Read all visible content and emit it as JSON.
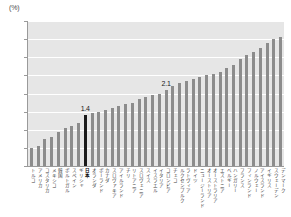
{
  "chart_data": {
    "type": "bar",
    "title": "",
    "xlabel": "",
    "ylabel": "",
    "unit_label": "(%)",
    "ylim": [
      0.0,
      4.0
    ],
    "ytick_labels": [
      "4.0",
      "3.5",
      "3.0",
      "2.5",
      "2.0",
      "1.5",
      "1.0",
      "0.5",
      "0.0"
    ],
    "ytick_values": [
      4.0,
      3.5,
      3.0,
      2.5,
      2.0,
      1.5,
      1.0,
      0.5,
      0.0
    ],
    "grid": true,
    "legend": "none",
    "categories": [
      "トルコ",
      "アメリカ",
      "コスタリカ",
      "メキシコ",
      "韓国",
      "ポルトガル",
      "スペイン",
      "ギリシャ",
      "日本",
      "オランダ",
      "ポーランド",
      "カナダ",
      "スロヴァキア",
      "アイルランド",
      "チリ",
      "リトアニア",
      "スロヴェニア",
      "スイス",
      "イスラエル",
      "イタリア",
      "コロンビア",
      "チェコ",
      "ルクセンブルク",
      "ラトヴィア",
      "ドイツ",
      "ニュージーランド",
      "オーストリア",
      "オーストラリア",
      "エストニア",
      "ベルギー",
      "ハンガリー",
      "フランス",
      "フィンランド",
      "ノルウェー",
      "アイスランド",
      "イギリス",
      "スウェーデン",
      "デンマーク"
    ],
    "values": [
      0.5,
      0.55,
      0.75,
      0.8,
      0.95,
      1.05,
      1.1,
      1.2,
      1.4,
      1.45,
      1.5,
      1.55,
      1.6,
      1.65,
      1.7,
      1.75,
      1.85,
      1.9,
      1.95,
      2.0,
      2.1,
      2.2,
      2.3,
      2.35,
      2.4,
      2.45,
      2.5,
      2.55,
      2.6,
      2.7,
      2.8,
      2.95,
      3.05,
      3.15,
      3.25,
      3.4,
      3.5,
      3.55
    ],
    "annotations": [
      {
        "category": "日本",
        "index": 8,
        "text": "1.4"
      },
      {
        "category": "コロンビア",
        "index": 20,
        "text": "2.1"
      }
    ],
    "highlighted_index": 8,
    "colors": {
      "bar": "#8c8c8c",
      "bar_highlight": "#1a1a1a",
      "plot_background": "#e6e6e6",
      "gridline": "#ffffff",
      "axis": "#9a9a9a",
      "text": "#3c3c3c"
    }
  }
}
